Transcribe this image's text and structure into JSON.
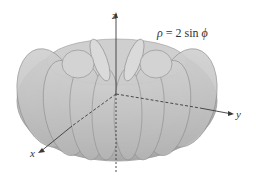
{
  "figure": {
    "equation": {
      "rho": "ρ",
      "equals": " = 2 sin ",
      "phi": "ϕ"
    },
    "axes": {
      "x_label": "x",
      "y_label": "y",
      "z_label": "z"
    },
    "colors": {
      "surface_light": "#d9d9d9",
      "surface_dark": "#a8a8a8",
      "outline": "#8c8c8c",
      "axis": "#3a3a3a",
      "background": "#ffffff"
    }
  }
}
